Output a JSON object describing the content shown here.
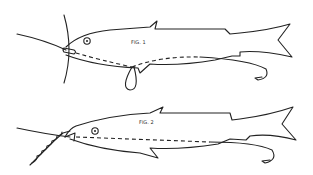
{
  "figures": [
    {
      "label": "FIG. 1",
      "description": "Fish bait rig with line through mouth, loop below belly, hook at tail"
    },
    {
      "label": "FIG. 2",
      "description": "Fish bait rig with twisted leader through mouth, hook at tail"
    }
  ],
  "colors": {
    "line": "#222222",
    "background": "#ffffff"
  }
}
